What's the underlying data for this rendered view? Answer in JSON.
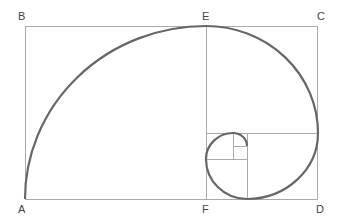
{
  "diagram": {
    "labels": {
      "A": "A",
      "B": "B",
      "C": "C",
      "D": "D",
      "E": "E",
      "F": "F"
    },
    "colors": {
      "line": "#aaaaaa",
      "spiral": "#666666",
      "text": "#444444"
    }
  }
}
